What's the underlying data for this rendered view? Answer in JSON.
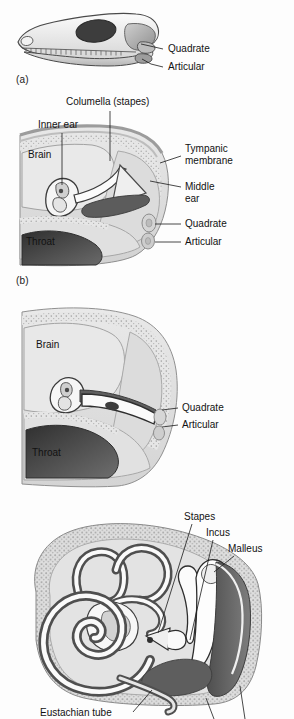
{
  "figure": {
    "background_color": "#fdfdfd",
    "ink_color": "#121212"
  },
  "palette": {
    "paper": "#fdfdfd",
    "tissue_light": "#e2e2e2",
    "tissue_mid": "#cfcfcf",
    "tissue_dark": "#9a9a9a",
    "cavity_dark": "#5d5d5d",
    "cavity_darker": "#3a3a3a",
    "bone_white": "#f7f7f7",
    "outline": "#6d6d6d",
    "outline_dark": "#2a2a2a",
    "stipple": "#b4b4b4"
  },
  "panels": [
    {
      "id": "a",
      "letter": "(a)",
      "caption_position": {
        "x": 16,
        "y": 76
      },
      "subject": "reptile-skull-lateral-view",
      "labels": [
        {
          "text": "Quadrate",
          "x": 168,
          "y": 52,
          "anchor": "start",
          "leader": [
            [
              163,
              49
            ],
            [
              150,
              45
            ],
            [
              140,
              41
            ]
          ]
        },
        {
          "text": "Articular",
          "x": 168,
          "y": 70,
          "anchor": "start",
          "leader": [
            [
              163,
              67
            ],
            [
              150,
              64
            ],
            [
              138,
              57
            ]
          ]
        }
      ]
    },
    {
      "id": "b",
      "letter": "(b)",
      "caption_position": {
        "x": 16,
        "y": 277
      },
      "subject": "reptile-ear-cross-section",
      "labels": [
        {
          "text": "Columella (stapes)",
          "x": 66,
          "y": 105,
          "anchor": "start",
          "leader": [
            [
              110,
              110
            ],
            [
              110,
              158
            ]
          ]
        },
        {
          "text": "Inner ear",
          "x": 38,
          "y": 128,
          "anchor": "start",
          "leader": [
            [
              62,
              133
            ],
            [
              62,
              180
            ]
          ]
        },
        {
          "text": "Brain",
          "x": 28,
          "y": 158,
          "anchor": "start",
          "leader": []
        },
        {
          "text": "Tympanic",
          "x": 185,
          "y": 152,
          "anchor": "start",
          "leader": [
            [
              181,
              156
            ],
            [
              160,
              163
            ]
          ]
        },
        {
          "text": "membrane",
          "x": 185,
          "y": 164,
          "anchor": "start",
          "leader": []
        },
        {
          "text": "Middle",
          "x": 185,
          "y": 190,
          "anchor": "start",
          "leader": [
            [
              181,
              187
            ],
            [
              150,
              181
            ]
          ]
        },
        {
          "text": "ear",
          "x": 185,
          "y": 202,
          "anchor": "start",
          "leader": []
        },
        {
          "text": "Quadrate",
          "x": 185,
          "y": 227,
          "anchor": "start",
          "leader": [
            [
              181,
              224
            ],
            [
              152,
              224
            ]
          ]
        },
        {
          "text": "Articular",
          "x": 185,
          "y": 245,
          "anchor": "start",
          "leader": [
            [
              181,
              242
            ],
            [
              152,
              242
            ]
          ]
        },
        {
          "text": "Throat",
          "x": 26,
          "y": 240,
          "anchor": "start",
          "leader": []
        }
      ]
    },
    {
      "id": "c",
      "letter": "(c)",
      "caption_position": {
        "x": 16,
        "y": 498
      },
      "subject": "transitional-ear-cross-section",
      "labels": [
        {
          "text": "Brain",
          "x": 36,
          "y": 345,
          "anchor": "start",
          "leader": []
        },
        {
          "text": "Quadrate",
          "x": 182,
          "y": 408,
          "anchor": "start",
          "leader": [
            [
              178,
              405
            ],
            [
              152,
              405
            ]
          ]
        },
        {
          "text": "Articular",
          "x": 182,
          "y": 425,
          "anchor": "start",
          "leader": [
            [
              178,
              422
            ],
            [
              152,
              422
            ]
          ]
        },
        {
          "text": "Throat",
          "x": 32,
          "y": 448,
          "anchor": "start",
          "leader": []
        }
      ]
    },
    {
      "id": "d",
      "letter": "",
      "caption_position": null,
      "subject": "mammalian-ear-cross-section",
      "labels": [
        {
          "text": "Stapes",
          "x": 184,
          "y": 518,
          "anchor": "start",
          "leader": [
            [
              192,
              522
            ],
            [
              165,
              625
            ]
          ]
        },
        {
          "text": "Incus",
          "x": 206,
          "y": 534,
          "anchor": "start",
          "leader": [
            [
              213,
              538
            ],
            [
              188,
              628
            ]
          ]
        },
        {
          "text": "Malleus",
          "x": 228,
          "y": 550,
          "anchor": "start",
          "leader": [
            [
              234,
              554
            ],
            [
              206,
              570
            ]
          ]
        },
        {
          "text": "Eustachian tube",
          "x": 40,
          "y": 714,
          "anchor": "start",
          "leader": [
            [
              133,
              710
            ],
            [
              152,
              688
            ]
          ]
        }
      ]
    }
  ],
  "anatomy_terms": [
    "Quadrate",
    "Articular",
    "Columella (stapes)",
    "Inner ear",
    "Brain",
    "Tympanic membrane",
    "Middle ear",
    "Throat",
    "Stapes",
    "Incus",
    "Malleus",
    "Eustachian tube"
  ]
}
